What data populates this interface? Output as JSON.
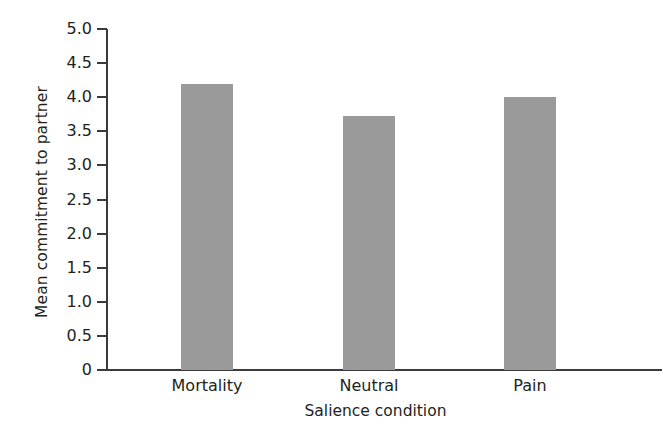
{
  "chart_data": {
    "type": "bar",
    "title": "",
    "subtitle": "",
    "xlabel": "Salience condition",
    "ylabel": "Mean commitment to partner",
    "categories": [
      "Mortality",
      "Neutral",
      "Pain"
    ],
    "values": [
      4.2,
      3.73,
      4.0
    ],
    "series": [
      {
        "name": "Mean commitment to partner",
        "values": [
          4.2,
          3.73,
          4.0
        ]
      }
    ],
    "ylim": [
      0,
      5.0
    ],
    "y_ticks": [
      5.0,
      4.5,
      4.0,
      3.5,
      3.0,
      2.5,
      2.0,
      1.5,
      1.0,
      0.5,
      0
    ],
    "y_tick_labels": [
      "5.0",
      "4.5",
      "4.0",
      "3.5",
      "3.0",
      "2.5",
      "2.0",
      "1.5",
      "1.0",
      "0.5",
      "0"
    ],
    "grid": false,
    "legend": "none",
    "bar_color": "#9a9a9a",
    "axis_color": "#3b3b3b",
    "background_color": "#ffffff",
    "text_color": "#231f20"
  }
}
